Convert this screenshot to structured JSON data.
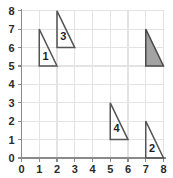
{
  "chart_data": {
    "type": "scatter",
    "title": "",
    "xlabel": "",
    "ylabel": "",
    "xlim": [
      0,
      8
    ],
    "ylim": [
      0,
      8
    ],
    "grid": true,
    "legend": false,
    "x_ticks": [
      "0",
      "1",
      "2",
      "3",
      "4",
      "5",
      "6",
      "7",
      "8"
    ],
    "y_ticks": [
      "0",
      "1",
      "2",
      "3",
      "4",
      "5",
      "6",
      "7",
      "8"
    ],
    "shapes": [
      {
        "label": "1",
        "kind": "right-triangle",
        "fill": "none",
        "vertices": [
          [
            1,
            7
          ],
          [
            1,
            5
          ],
          [
            2,
            5
          ]
        ],
        "label_at": [
          1.35,
          5.5
        ]
      },
      {
        "label": "3",
        "kind": "right-triangle",
        "fill": "none",
        "vertices": [
          [
            2,
            8
          ],
          [
            2,
            6
          ],
          [
            3,
            6
          ]
        ],
        "label_at": [
          2.35,
          6.55
        ]
      },
      {
        "label": "",
        "kind": "right-triangle",
        "fill": "#a3a3a3",
        "vertices": [
          [
            7,
            7
          ],
          [
            7,
            5
          ],
          [
            8,
            5
          ]
        ],
        "label_at": [
          7.35,
          5.5
        ]
      },
      {
        "label": "4",
        "kind": "right-triangle",
        "fill": "none",
        "vertices": [
          [
            5,
            3
          ],
          [
            5,
            1
          ],
          [
            6,
            1
          ]
        ],
        "label_at": [
          5.35,
          1.55
        ]
      },
      {
        "label": "2",
        "kind": "right-triangle",
        "fill": "none",
        "vertices": [
          [
            7,
            2
          ],
          [
            7,
            0
          ],
          [
            8,
            0
          ]
        ],
        "label_at": [
          7.35,
          0.5
        ]
      }
    ]
  },
  "colors": {
    "grid": "#e3e3e3",
    "axis": "#8a8a8a",
    "outline": "#555555",
    "shaded_fill": "#a3a3a3",
    "text": "#2b2b2b",
    "background": "#ffffff"
  }
}
